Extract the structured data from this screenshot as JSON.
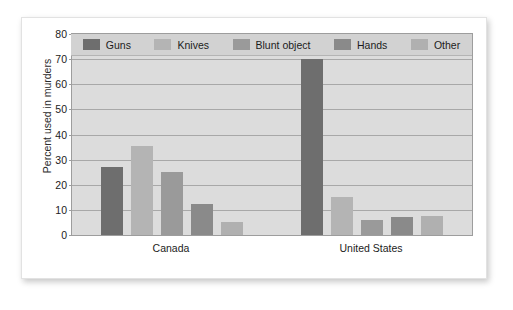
{
  "chart_data": {
    "type": "bar",
    "title": "",
    "xlabel": "",
    "ylabel": "Percent used in murders",
    "ylim": [
      0,
      80
    ],
    "yticks": [
      0,
      10,
      20,
      30,
      40,
      50,
      60,
      70,
      80
    ],
    "grid": true,
    "legend_position": "top-inside",
    "categories": [
      "Canada",
      "United States"
    ],
    "series": [
      {
        "name": "Guns",
        "color": "#6e6e6e",
        "values": [
          27,
          70
        ]
      },
      {
        "name": "Knives",
        "color": "#b4b4b4",
        "values": [
          35.5,
          15
        ]
      },
      {
        "name": "Blunt object",
        "color": "#9a9a9a",
        "values": [
          25,
          6
        ]
      },
      {
        "name": "Hands",
        "color": "#8a8a8a",
        "values": [
          12.5,
          7
        ]
      },
      {
        "name": "Other",
        "color": "#b0b0b0",
        "values": [
          5,
          7.5
        ]
      }
    ]
  }
}
